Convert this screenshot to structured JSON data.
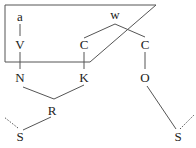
{
  "diagram": {
    "stroke_color": "#555555",
    "label_color": "#222222",
    "nodes": {
      "a": {
        "label": "a",
        "x": 20,
        "y": 21
      },
      "V": {
        "label": "V",
        "x": 20,
        "y": 49
      },
      "N": {
        "label": "N",
        "x": 20,
        "y": 82
      },
      "C1": {
        "label": "C",
        "x": 84,
        "y": 49
      },
      "K": {
        "label": "K",
        "x": 84,
        "y": 82
      },
      "w": {
        "label": "w",
        "x": 115,
        "y": 19
      },
      "C2": {
        "label": "C",
        "x": 145,
        "y": 49
      },
      "O": {
        "label": "O",
        "x": 145,
        "y": 82
      },
      "R": {
        "label": "R",
        "x": 52,
        "y": 115
      },
      "S1": {
        "label": "S",
        "x": 20,
        "y": 141
      },
      "S2": {
        "label": "S",
        "x": 178,
        "y": 141
      }
    }
  }
}
